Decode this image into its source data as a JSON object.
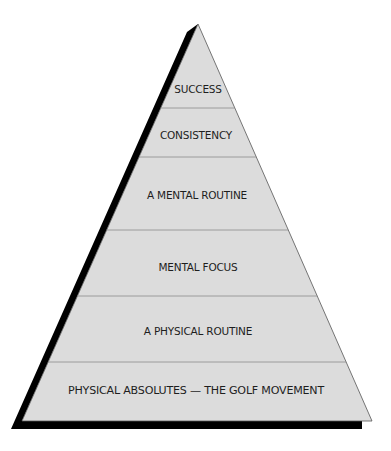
{
  "diagram": {
    "type": "pyramid",
    "colors": {
      "fill": "#dcdcdc",
      "outline": "#555555",
      "divider": "#8a8a8a",
      "shadow": "#000000",
      "text": "#1e1e1e"
    },
    "levels": [
      {
        "label": "SUCCESS"
      },
      {
        "label": "CONSISTENCY"
      },
      {
        "label": "A MENTAL ROUTINE"
      },
      {
        "label": "MENTAL FOCUS"
      },
      {
        "label": "A PHYSICAL ROUTINE"
      },
      {
        "label": "PHYSICAL ABSOLUTES — THE GOLF MOVEMENT"
      }
    ]
  }
}
